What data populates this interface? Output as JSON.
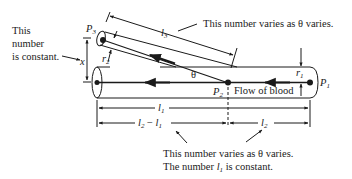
{
  "labels": {
    "left_note_line1": "This",
    "left_note_line2": "number",
    "left_note_line3": "is constant.",
    "top_note": "This number varies as θ varies.",
    "bottom_note_line1": "This number varies as θ varies.",
    "bottom_note_line2_a": "The number ",
    "bottom_note_line2_var": "l",
    "bottom_note_line2_sub": "1",
    "bottom_note_line2_b": " is constant.",
    "flow": "Flow of blood",
    "theta": "θ",
    "x": "x"
  },
  "points": {
    "p1": {
      "name": "P",
      "sub": "1"
    },
    "p2": {
      "name": "P",
      "sub": "2"
    },
    "p3": {
      "name": "P",
      "sub": "3"
    }
  },
  "dimensions": {
    "l1": {
      "name": "l",
      "sub": "1"
    },
    "l2": {
      "name": "l",
      "sub": "2"
    },
    "l3": {
      "name": "l",
      "sub": "3"
    },
    "l2_minus_l1": {
      "a": "l",
      "a_sub": "2",
      "op": " − ",
      "b": "l",
      "b_sub": "1"
    },
    "r1": {
      "name": "r",
      "sub": "1"
    },
    "r2": {
      "name": "r",
      "sub": "2"
    }
  },
  "colors": {
    "ink": "#1a1a1a",
    "background": "#ffffff"
  }
}
